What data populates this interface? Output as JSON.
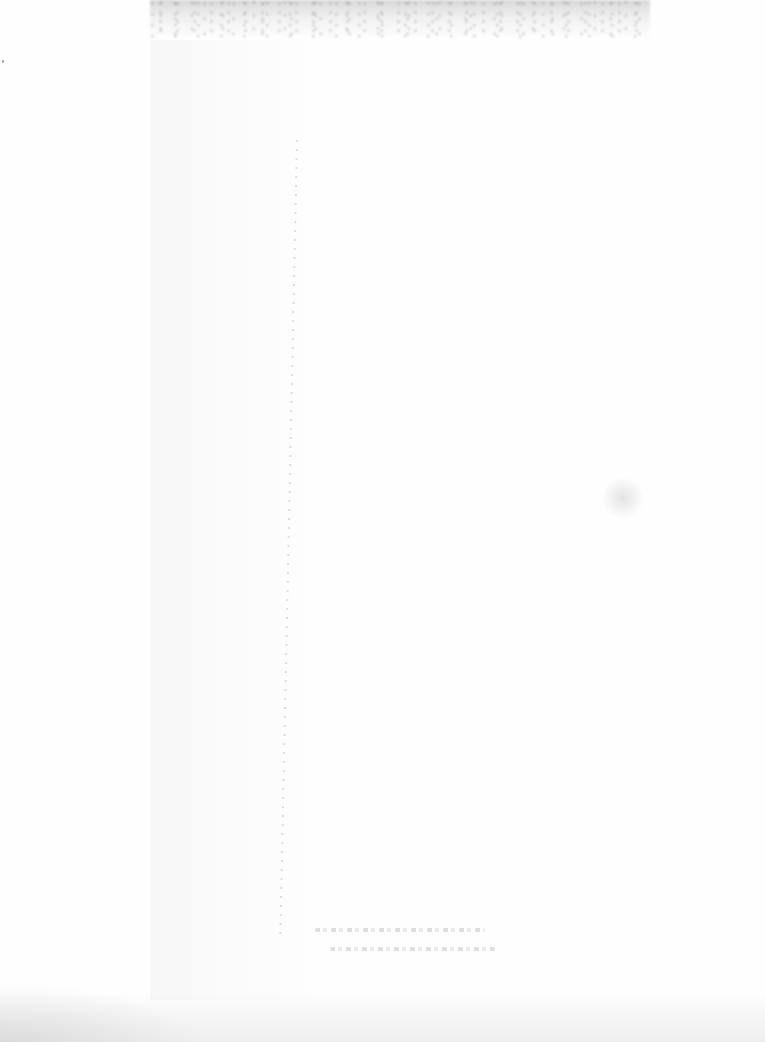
{
  "document": {
    "type": "blank scanned page",
    "title": "",
    "body_text": "",
    "footer_text": ""
  }
}
